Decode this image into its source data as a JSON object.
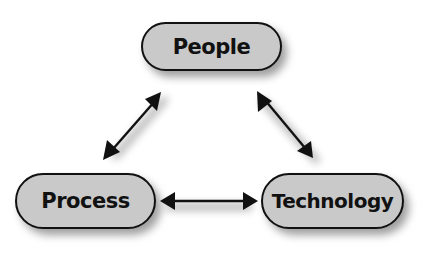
{
  "diagram": {
    "type": "triangle-cycle",
    "nodes": [
      {
        "id": "people",
        "label": "People"
      },
      {
        "id": "process",
        "label": "Process"
      },
      {
        "id": "technology",
        "label": "Technology"
      }
    ],
    "edges": [
      {
        "from": "people",
        "to": "process",
        "direction": "bidirectional"
      },
      {
        "from": "people",
        "to": "technology",
        "direction": "bidirectional"
      },
      {
        "from": "process",
        "to": "technology",
        "direction": "bidirectional"
      }
    ],
    "colors": {
      "node_fill": "#c9c9c9",
      "node_border": "#111111",
      "text": "#111111",
      "arrow": "#111111",
      "background": "#ffffff"
    }
  }
}
